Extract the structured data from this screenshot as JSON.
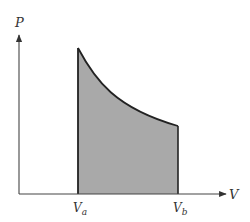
{
  "diagram": {
    "type": "pv-diagram",
    "axes": {
      "y_label": "P",
      "x_label": "V"
    },
    "ticks": [
      {
        "main": "V",
        "sub": "a"
      },
      {
        "main": "V",
        "sub": "b"
      }
    ],
    "region": {
      "description": "shaded area under curve between Va and Vb",
      "fill_color": "#a9a9a9",
      "stroke_color": "#222222"
    },
    "axis_color": "#444444"
  }
}
